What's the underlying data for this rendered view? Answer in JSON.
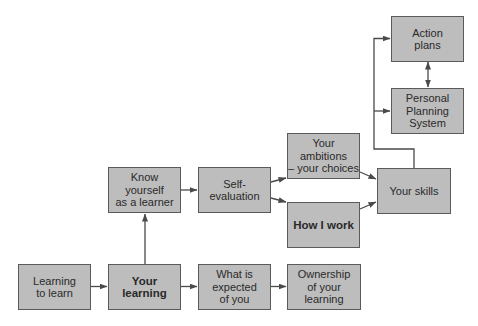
{
  "diagram": {
    "style": {
      "box_fill": "#bdbdbd",
      "box_border": "#5a5a5a",
      "line_color": "#4a4a4a",
      "text_color": "#2a2a2a"
    },
    "nodes": {
      "learning_to_learn": {
        "label": "Learning\nto learn",
        "bold": false
      },
      "your_learning": {
        "label": "Your\nlearning",
        "bold": true
      },
      "what_is_expected": {
        "label": "What is\nexpected\nof you",
        "bold": false
      },
      "ownership": {
        "label": "Ownership\nof your\nlearning",
        "bold": false
      },
      "know_yourself": {
        "label": "Know\nyourself\nas a learner",
        "bold": false
      },
      "self_evaluation": {
        "label": "Self-\nevaluation",
        "bold": false
      },
      "your_ambitions": {
        "label": "Your\nambitions\n– your choices",
        "bold": false
      },
      "how_i_work": {
        "label": "How I work",
        "bold": true
      },
      "your_skills": {
        "label": "Your skills",
        "bold": false
      },
      "action_plans": {
        "label": "Action\nplans",
        "bold": false
      },
      "personal_planning": {
        "label": "Personal\nPlanning\nSystem",
        "bold": false
      }
    },
    "edges": [
      {
        "from": "learning_to_learn",
        "to": "your_learning"
      },
      {
        "from": "your_learning",
        "to": "what_is_expected"
      },
      {
        "from": "what_is_expected",
        "to": "ownership"
      },
      {
        "from": "your_learning",
        "to": "know_yourself"
      },
      {
        "from": "know_yourself",
        "to": "self_evaluation"
      },
      {
        "from": "self_evaluation",
        "to": "your_ambitions"
      },
      {
        "from": "self_evaluation",
        "to": "how_i_work"
      },
      {
        "from": "your_ambitions",
        "to": "your_skills"
      },
      {
        "from": "how_i_work",
        "to": "your_skills"
      },
      {
        "from": "your_skills",
        "to": "action_plans"
      },
      {
        "from": "your_skills",
        "to": "personal_planning"
      },
      {
        "from": "action_plans",
        "to": "personal_planning",
        "bidirectional": true
      }
    ]
  }
}
